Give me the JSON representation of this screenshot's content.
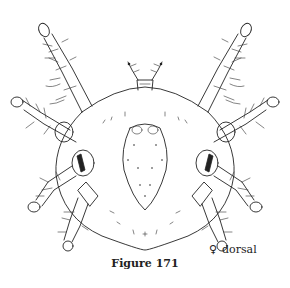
{
  "figure": {
    "view": "dorsal",
    "sex_symbol": "♀",
    "caption": "Figure 171"
  },
  "labels": {
    "sex_symbol": "♀",
    "view": "dorsal",
    "caption": "Figure 171"
  },
  "colors": {
    "ink": "#222222",
    "background": "#ffffff"
  }
}
